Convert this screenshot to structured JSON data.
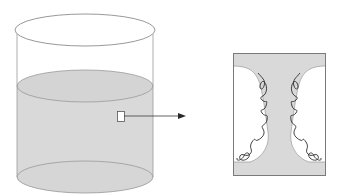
{
  "diagram": {
    "type": "beaker-with-magnified-inset",
    "colors": {
      "background": "#ffffff",
      "outline": "#8c8c8c",
      "liquid_fill": "#d9d9d9",
      "inset_border": "#7a7a7a",
      "strand": "#2b2b2b",
      "arrow": "#3a3a3a"
    },
    "beaker": {
      "rim": {
        "cx": 85,
        "cy": 30,
        "rx": 70,
        "ry": 16
      },
      "body": {
        "left": 17,
        "right": 153,
        "top": 30,
        "bottom": 177
      },
      "liquid_surface": {
        "cx": 85,
        "cy": 86,
        "rx": 68,
        "ry": 16
      },
      "bottom": {
        "cx": 85,
        "cy": 177,
        "rx": 68,
        "ry": 16
      }
    },
    "sample_marker": {
      "x": 117,
      "y": 111,
      "width": 7,
      "height": 10
    },
    "arrow": {
      "x1": 124,
      "y1": 116,
      "x2": 185,
      "y2": 116
    },
    "inset": {
      "x": 233,
      "y": 53,
      "width": 93,
      "height": 123
    }
  }
}
